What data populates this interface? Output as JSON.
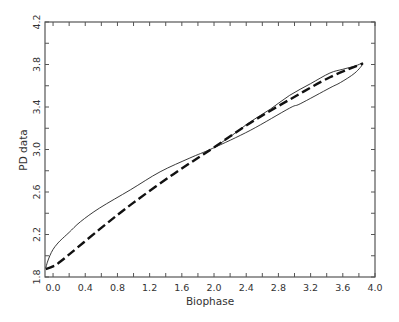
{
  "chart_data": {
    "type": "line",
    "title": "",
    "xlabel": "Biophase",
    "ylabel": "PD data",
    "xlim": [
      -0.1,
      4.0
    ],
    "ylim": [
      1.8,
      4.2
    ],
    "xticks": [
      "0.0",
      "0.4",
      "0.8",
      "1.2",
      "1.6",
      "2.0",
      "2.4",
      "2.8",
      "3.2",
      "3.6",
      "4.0"
    ],
    "xtick_values": [
      0.0,
      0.4,
      0.8,
      1.2,
      1.6,
      2.0,
      2.4,
      2.8,
      3.2,
      3.6,
      4.0
    ],
    "yticks": [
      "1.8",
      "2.2",
      "2.6",
      "3.0",
      "3.4",
      "3.8",
      "4.2"
    ],
    "ytick_values": [
      1.8,
      2.2,
      2.6,
      3.0,
      3.4,
      3.8,
      4.2
    ],
    "grid": false,
    "legend": null,
    "series": [
      {
        "name": "observed (hysteresis loop)",
        "style": "solid-thin",
        "color": "#222222",
        "x": [
          -0.09,
          -0.07,
          -0.04,
          0.0,
          0.05,
          0.1,
          0.2,
          0.34,
          0.58,
          0.96,
          1.33,
          1.7,
          1.98,
          2.45,
          2.94,
          3.07,
          3.44,
          3.57,
          3.75,
          3.85,
          3.75,
          3.6,
          3.44,
          3.2,
          2.94,
          2.7,
          2.45,
          2.2,
          2.0
        ],
        "y": [
          1.885,
          1.94,
          2.0,
          2.06,
          2.11,
          2.15,
          2.22,
          2.32,
          2.45,
          2.62,
          2.79,
          2.92,
          3.01,
          3.18,
          3.39,
          3.43,
          3.58,
          3.63,
          3.72,
          3.81,
          3.785,
          3.755,
          3.72,
          3.62,
          3.51,
          3.38,
          3.26,
          3.12,
          3.02
        ]
      },
      {
        "name": "model fit",
        "style": "dashed-thick",
        "color": "#111111",
        "x": [
          -0.09,
          0.0,
          0.1,
          0.58,
          1.0,
          1.5,
          1.98,
          2.45,
          2.94,
          3.44,
          3.85
        ],
        "y": [
          1.875,
          1.9,
          1.95,
          2.25,
          2.5,
          2.77,
          3.01,
          3.25,
          3.47,
          3.68,
          3.81
        ]
      }
    ]
  },
  "axes": {
    "xlabel": "Biophase",
    "ylabel": "PD data"
  }
}
